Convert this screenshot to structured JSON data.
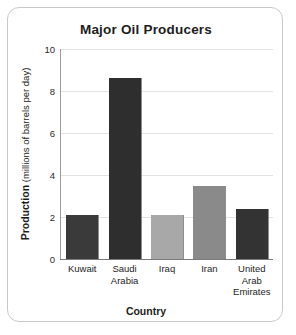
{
  "chart_data": {
    "type": "bar",
    "title": "Major Oil Producers",
    "xlabel": "Country",
    "ylabel": "Production (millions of barrels per day)",
    "ylabel_strong": "Production",
    "ylabel_light": " (millions of barrels per day)",
    "categories": [
      "Kuwait",
      "Saudi Arabia",
      "Iraq",
      "Iran",
      "United Arab Emirates"
    ],
    "category_lines": [
      [
        "Kuwait"
      ],
      [
        "Saudi",
        "Arabia"
      ],
      [
        "Iraq"
      ],
      [
        "Iran"
      ],
      [
        "United",
        "Arab",
        "Emirates"
      ]
    ],
    "values": [
      2.1,
      8.6,
      2.1,
      3.5,
      2.4
    ],
    "bar_colors": [
      "#3a3a3a",
      "#2e2e2e",
      "#a8a8a8",
      "#8a8a8a",
      "#333333"
    ],
    "ylim": [
      0,
      10
    ],
    "yticks": [
      0,
      2,
      4,
      6,
      8,
      10
    ],
    "ytick_labels": [
      "0",
      "2",
      "4",
      "6",
      "8",
      "10"
    ],
    "grid": true,
    "legend": false
  },
  "style": {
    "frame_border_color": "#c9c9c9",
    "gridline_color": "#e2e2e2",
    "axis_color": "#7a7a7a",
    "text_color": "#1d1d1d",
    "background": "#ffffff"
  }
}
